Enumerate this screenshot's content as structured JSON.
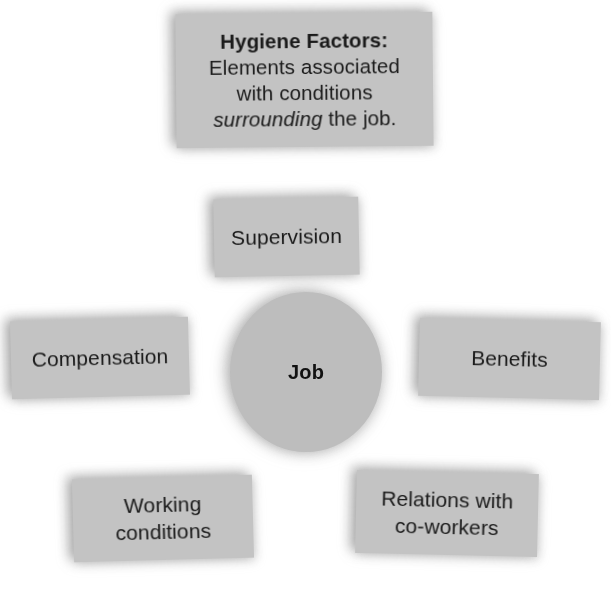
{
  "diagram": {
    "type": "hub-and-spoke",
    "background_color": "#ffffff",
    "node_fill_color": "#c3c3c3",
    "circle_fill_color": "#bdbdbd",
    "text_color": "#1a1a1a"
  },
  "header": {
    "title": "Hygiene Factors:",
    "line1": "Elements associated",
    "line2": "with conditions",
    "line3_emphasis": "surrounding",
    "line3_rest": " the job."
  },
  "center": {
    "label": "Job"
  },
  "factors": [
    {
      "label": "Supervision",
      "line1": "Supervision",
      "line2": ""
    },
    {
      "label": "Compensation",
      "line1": "Compensation",
      "line2": ""
    },
    {
      "label": "Benefits",
      "line1": "Benefits",
      "line2": ""
    },
    {
      "label": "Working conditions",
      "line1": "Working",
      "line2": "conditions"
    },
    {
      "label": "Relations with co-workers",
      "line1": "Relations with",
      "line2": "co-workers"
    }
  ]
}
